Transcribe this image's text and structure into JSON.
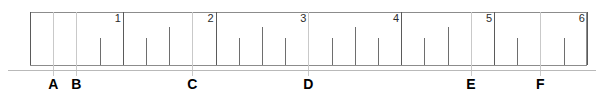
{
  "figure": {
    "kind": "ruler-diagram",
    "colors": {
      "background": "#ffffff",
      "ruler_border": "#8c8c8c",
      "tick": "#6e6e6e",
      "major_tick": "#5a5a5a",
      "leader_line": "#c9c9c9",
      "baseline": "#b9b9b9",
      "number_text": "#2b2b2b",
      "letter_text": "#000000"
    }
  },
  "chart_data": {
    "type": "line",
    "title": "",
    "subtitle": "",
    "xlabel": "",
    "ylabel": "",
    "xlim": [
      0,
      6
    ],
    "grid": false,
    "legend": "none",
    "minor_tick_interval": 0.25,
    "major_tick_interval": 1,
    "axis_tick_labels": [
      "1",
      "2",
      "3",
      "4",
      "5",
      "6"
    ],
    "axis_tick_values": [
      1,
      2,
      3,
      4,
      5,
      6
    ],
    "ticks": [
      {
        "value": 0.0,
        "size": "major"
      },
      {
        "value": 0.25,
        "size": "minor"
      },
      {
        "value": 0.5,
        "size": "medium"
      },
      {
        "value": 0.75,
        "size": "minor"
      },
      {
        "value": 1.0,
        "size": "major"
      },
      {
        "value": 1.25,
        "size": "minor"
      },
      {
        "value": 1.5,
        "size": "medium"
      },
      {
        "value": 1.75,
        "size": "minor"
      },
      {
        "value": 2.0,
        "size": "major"
      },
      {
        "value": 2.25,
        "size": "minor"
      },
      {
        "value": 2.5,
        "size": "medium"
      },
      {
        "value": 2.75,
        "size": "minor"
      },
      {
        "value": 3.0,
        "size": "major"
      },
      {
        "value": 3.25,
        "size": "minor"
      },
      {
        "value": 3.5,
        "size": "medium"
      },
      {
        "value": 3.75,
        "size": "minor"
      },
      {
        "value": 4.0,
        "size": "major"
      },
      {
        "value": 4.25,
        "size": "minor"
      },
      {
        "value": 4.5,
        "size": "medium"
      },
      {
        "value": 4.75,
        "size": "minor"
      },
      {
        "value": 5.0,
        "size": "major"
      },
      {
        "value": 5.25,
        "size": "minor"
      },
      {
        "value": 5.5,
        "size": "medium"
      },
      {
        "value": 5.75,
        "size": "minor"
      },
      {
        "value": 6.0,
        "size": "major"
      }
    ],
    "annotations": [
      {
        "label": "A",
        "value": 0.25
      },
      {
        "label": "B",
        "value": 0.5
      },
      {
        "label": "C",
        "value": 1.75
      },
      {
        "label": "D",
        "value": 3.0
      },
      {
        "label": "E",
        "value": 4.75
      },
      {
        "label": "F",
        "value": 5.5
      }
    ]
  }
}
